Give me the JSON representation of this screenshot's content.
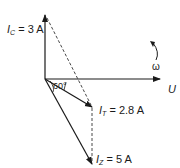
{
  "diagram": {
    "title_fragment": "",
    "labels": {
      "ic": {
        "symbol": "I",
        "subscript": "C",
        "value": "= 3 A"
      },
      "it": {
        "symbol": "I",
        "subscript": "T",
        "value": "= 2.8 A"
      },
      "iz": {
        "symbol": "I",
        "subscript": "Z",
        "value": "= 5 A"
      },
      "u": "U",
      "omega": "ω",
      "angle": "60°"
    },
    "vectors": [
      {
        "name": "I_C",
        "magnitude": 3,
        "unit": "A",
        "direction": "up"
      },
      {
        "name": "U",
        "direction": "right",
        "reference": true
      },
      {
        "name": "I_T",
        "magnitude": 2.8,
        "unit": "A"
      },
      {
        "name": "I_Z",
        "magnitude": 5,
        "unit": "A",
        "angle_to_U_deg": 60
      }
    ],
    "colors": {
      "line": "#1a1a1a",
      "dashed": "#333333"
    }
  }
}
